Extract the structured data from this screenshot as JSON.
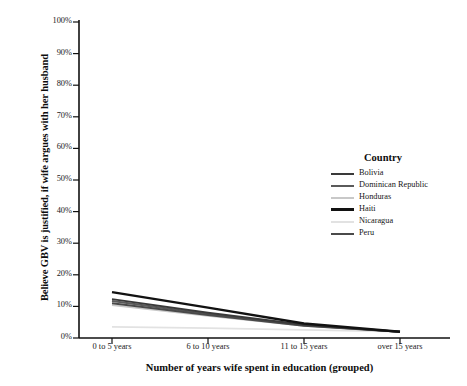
{
  "chart_data": {
    "type": "line",
    "title": "",
    "subtitle": "",
    "xlabel": "Number of years wife spent in education (grouped)",
    "ylabel": "Believe GBV is justified, if wife argues with her husband",
    "categories": [
      "0 to 5 years",
      "6 to 10 years",
      "11 to 15 years",
      "over 15 years"
    ],
    "ylim": [
      0,
      100
    ],
    "y_ticks": [
      "0%",
      "10%",
      "20%",
      "30%",
      "40%",
      "50%",
      "60%",
      "70%",
      "80%",
      "90%",
      "100%"
    ],
    "y_tick_values": [
      0,
      10,
      20,
      30,
      40,
      50,
      60,
      70,
      80,
      90,
      100
    ],
    "grid": false,
    "legend_position": "inside-right",
    "legend_title": "Country",
    "series": [
      {
        "name": "Bolivia",
        "values": [
          12.3,
          8.0,
          4.2,
          2.0
        ],
        "color": "#3a3a3a",
        "width": 2.0
      },
      {
        "name": "Dominican Republic",
        "values": [
          11.7,
          7.6,
          4.0,
          2.0
        ],
        "color": "#5a5a5a",
        "width": 2.0
      },
      {
        "name": "Honduras",
        "values": [
          10.4,
          7.0,
          3.8,
          2.0
        ],
        "color": "#c8c8c8",
        "width": 1.7
      },
      {
        "name": "Haiti",
        "values": [
          14.5,
          9.6,
          4.6,
          2.0
        ],
        "color": "#121212",
        "width": 2.4
      },
      {
        "name": "Nicaragua",
        "values": [
          3.5,
          3.1,
          2.6,
          2.0
        ],
        "color": "#e2e2e2",
        "width": 1.7
      },
      {
        "name": "Peru",
        "values": [
          11.0,
          7.3,
          3.9,
          2.0
        ],
        "color": "#4a4a4a",
        "width": 2.0
      }
    ]
  },
  "axes": {
    "y_title": "Believe GBV is justified, if wife argues with her husband",
    "x_title": "Number of years wife spent in education (grouped)",
    "y_labels": [
      "100%",
      "90%",
      "80%",
      "70%",
      "60%",
      "50%",
      "40%",
      "30%",
      "20%",
      "10%",
      "0%"
    ],
    "x_labels": [
      "0 to 5 years",
      "6 to 10 years",
      "11 to 15 years",
      "over 15 years"
    ]
  },
  "legend": {
    "title": "Country",
    "items": [
      {
        "label": "Bolivia"
      },
      {
        "label": "Dominican Republic"
      },
      {
        "label": "Honduras"
      },
      {
        "label": "Haiti"
      },
      {
        "label": "Nicaragua"
      },
      {
        "label": "Peru"
      }
    ]
  }
}
